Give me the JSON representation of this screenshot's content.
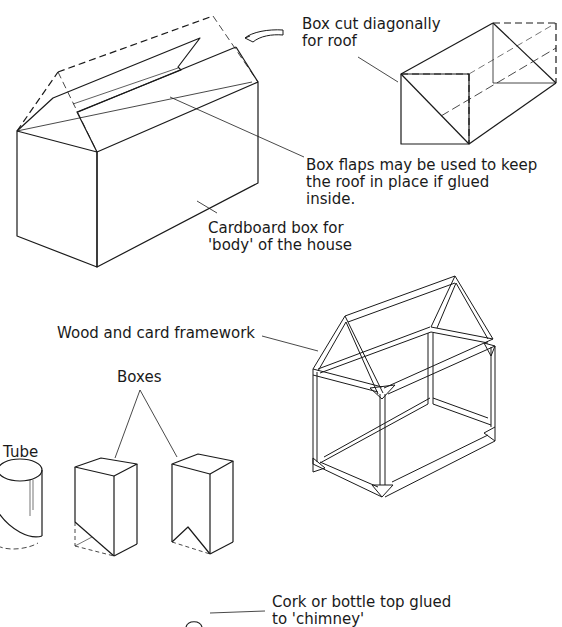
{
  "labels": {
    "roof_cut": "Box cut diagonally\nfor roof",
    "flaps": "Box flaps may be used to keep\nthe roof in place if glued\ninside.",
    "body": "Cardboard box for\n'body' of the house",
    "framework": "Wood and card framework",
    "boxes": "Boxes",
    "tube": "Tube",
    "chimney": "Cork or bottle top glued\nto 'chimney'"
  },
  "colors": {
    "line": "#1a1a1a",
    "background": "#ffffff"
  }
}
